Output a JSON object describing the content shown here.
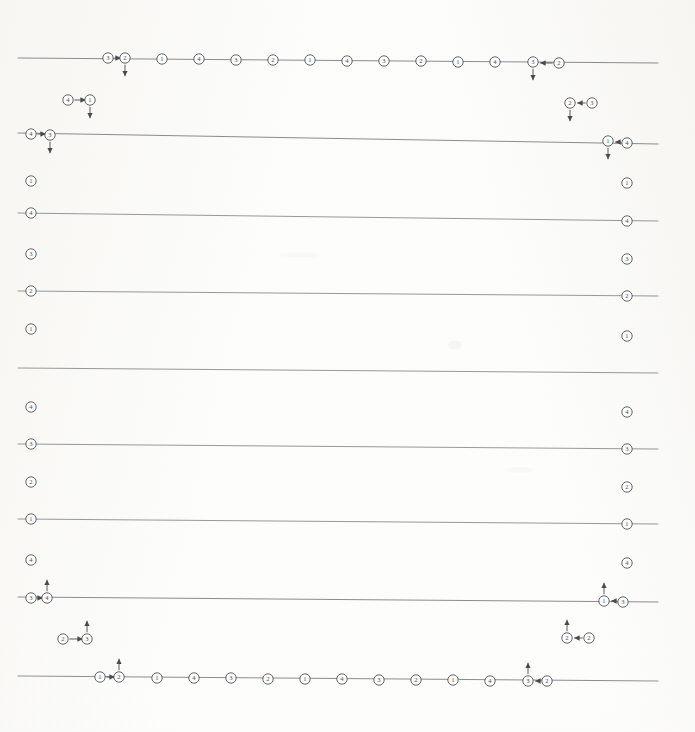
{
  "document": {
    "kind": "scanned-line-diagram",
    "width": 695,
    "height": 732,
    "background_color": "#fdfdfb",
    "ink_color": "#4a4a4a",
    "line_color": "#6b6b6b",
    "node_label_color": "#3c3c3c",
    "description": "Faded grayscale scan of a periodic lattice / transfer diagram: twelve near-horizontal rules carrying circled numeric site markers, with mirrored edge-node columns and arrow-annotated node pairs."
  },
  "geometry": {
    "line_left_x": 18,
    "line_right_x": 658,
    "node_radius": 5.2,
    "edge_left_x": 31,
    "edge_right_x": 627
  },
  "rules": [
    {
      "id": "rule-1",
      "y_left": 58,
      "y_right": 63,
      "weight": 0.9
    },
    {
      "id": "rule-2",
      "y_left": 133,
      "y_right": 144,
      "weight": 0.9
    },
    {
      "id": "rule-3",
      "y_left": 213,
      "y_right": 221,
      "weight": 0.8
    },
    {
      "id": "rule-4",
      "y_left": 291,
      "y_right": 296,
      "weight": 0.8
    },
    {
      "id": "rule-5",
      "y_left": 368,
      "y_right": 373,
      "weight": 0.8
    },
    {
      "id": "rule-6",
      "y_left": 444,
      "y_right": 449,
      "weight": 0.8
    },
    {
      "id": "rule-7",
      "y_left": 519,
      "y_right": 524,
      "weight": 0.8
    },
    {
      "id": "rule-8",
      "y_left": 597,
      "y_right": 602,
      "weight": 0.9
    },
    {
      "id": "rule-9",
      "y_left": 676,
      "y_right": 681,
      "weight": 0.9
    }
  ],
  "top_row": {
    "rule": "rule-1",
    "label": "top-site-row",
    "nodes": [
      {
        "x": 108,
        "y": 58,
        "label": "3"
      },
      {
        "x": 125,
        "y": 58,
        "label": "2",
        "down_arrow": true
      },
      {
        "x": 162,
        "y": 59,
        "label": "1"
      },
      {
        "x": 199,
        "y": 59,
        "label": "4"
      },
      {
        "x": 236,
        "y": 60,
        "label": "3"
      },
      {
        "x": 273,
        "y": 60,
        "label": "2"
      },
      {
        "x": 310,
        "y": 60,
        "label": "1"
      },
      {
        "x": 347,
        "y": 61,
        "label": "4"
      },
      {
        "x": 384,
        "y": 61,
        "label": "3"
      },
      {
        "x": 421,
        "y": 61,
        "label": "2"
      },
      {
        "x": 458,
        "y": 62,
        "label": "1"
      },
      {
        "x": 495,
        "y": 62,
        "label": "4"
      },
      {
        "x": 533,
        "y": 62,
        "label": "3",
        "down_arrow": true
      },
      {
        "x": 559,
        "y": 63,
        "label": "2"
      }
    ],
    "connectors": [
      {
        "from_x": 108,
        "to_x": 125,
        "y": 58,
        "direction": "right"
      },
      {
        "from_x": 559,
        "to_x": 536,
        "y": 63,
        "direction": "left"
      }
    ]
  },
  "bottom_row": {
    "rule": "rule-9",
    "label": "bottom-site-row",
    "nodes": [
      {
        "x": 100,
        "y": 677,
        "label": "1"
      },
      {
        "x": 119,
        "y": 677,
        "label": "2",
        "up_arrow": true
      },
      {
        "x": 157,
        "y": 678,
        "label": "1"
      },
      {
        "x": 194,
        "y": 678,
        "label": "4"
      },
      {
        "x": 231,
        "y": 678,
        "label": "3"
      },
      {
        "x": 268,
        "y": 679,
        "label": "2"
      },
      {
        "x": 305,
        "y": 679,
        "label": "1"
      },
      {
        "x": 342,
        "y": 679,
        "label": "4"
      },
      {
        "x": 379,
        "y": 680,
        "label": "3"
      },
      {
        "x": 416,
        "y": 680,
        "label": "2"
      },
      {
        "x": 453,
        "y": 680,
        "label": "1"
      },
      {
        "x": 490,
        "y": 681,
        "label": "4"
      },
      {
        "x": 528,
        "y": 681,
        "label": "3",
        "up_arrow": true
      },
      {
        "x": 547,
        "y": 681,
        "label": "2"
      }
    ],
    "connectors": [
      {
        "from_x": 100,
        "to_x": 119,
        "y": 677,
        "direction": "right"
      },
      {
        "from_x": 547,
        "to_x": 531,
        "y": 681,
        "direction": "left"
      }
    ]
  },
  "left_column": {
    "label": "left-edge-sites",
    "nodes": [
      {
        "x": 31,
        "y": 134,
        "label": "4",
        "on_rule": true
      },
      {
        "x": 50,
        "y": 135,
        "label": "3",
        "on_rule": true,
        "down_arrow": true
      },
      {
        "x": 31,
        "y": 181,
        "label": "1",
        "on_rule": false
      },
      {
        "x": 31,
        "y": 213,
        "label": "4",
        "on_rule": true
      },
      {
        "x": 31,
        "y": 254,
        "label": "3",
        "on_rule": false
      },
      {
        "x": 31,
        "y": 291,
        "label": "2",
        "on_rule": true
      },
      {
        "x": 31,
        "y": 329,
        "label": "1",
        "on_rule": false
      },
      {
        "x": 31,
        "y": 407,
        "label": "4",
        "on_rule": false
      },
      {
        "x": 31,
        "y": 444,
        "label": "3",
        "on_rule": true
      },
      {
        "x": 31,
        "y": 482,
        "label": "2",
        "on_rule": false
      },
      {
        "x": 31,
        "y": 519,
        "label": "1",
        "on_rule": true
      },
      {
        "x": 31,
        "y": 560,
        "label": "4",
        "on_rule": false
      },
      {
        "x": 31,
        "y": 598,
        "label": "3",
        "on_rule": true
      },
      {
        "x": 47,
        "y": 598,
        "label": "4",
        "on_rule": true,
        "up_arrow": true
      }
    ],
    "connectors": [
      {
        "from_x": 31,
        "to_x": 50,
        "y": 134,
        "direction": "right"
      },
      {
        "from_x": 31,
        "to_x": 47,
        "y": 598,
        "direction": "right"
      }
    ]
  },
  "right_column": {
    "label": "right-edge-sites",
    "nodes": [
      {
        "x": 608,
        "y": 141,
        "label": "1",
        "on_rule": true,
        "down_arrow": true
      },
      {
        "x": 627,
        "y": 143,
        "label": "4",
        "on_rule": true
      },
      {
        "x": 627,
        "y": 183,
        "label": "1",
        "on_rule": false
      },
      {
        "x": 627,
        "y": 221,
        "label": "4",
        "on_rule": true
      },
      {
        "x": 627,
        "y": 259,
        "label": "3",
        "on_rule": false
      },
      {
        "x": 627,
        "y": 296,
        "label": "2",
        "on_rule": true
      },
      {
        "x": 627,
        "y": 336,
        "label": "1",
        "on_rule": false
      },
      {
        "x": 627,
        "y": 412,
        "label": "4",
        "on_rule": false
      },
      {
        "x": 627,
        "y": 449,
        "label": "3",
        "on_rule": true
      },
      {
        "x": 627,
        "y": 487,
        "label": "2",
        "on_rule": false
      },
      {
        "x": 627,
        "y": 524,
        "label": "1",
        "on_rule": true
      },
      {
        "x": 627,
        "y": 563,
        "label": "4",
        "on_rule": false
      },
      {
        "x": 604,
        "y": 601,
        "label": "1",
        "on_rule": true,
        "up_arrow": true
      },
      {
        "x": 623,
        "y": 602,
        "label": "3",
        "on_rule": true
      }
    ],
    "connectors": [
      {
        "from_x": 627,
        "to_x": 611,
        "y": 142,
        "direction": "left"
      },
      {
        "from_x": 623,
        "to_x": 607,
        "y": 601,
        "direction": "left"
      }
    ]
  },
  "floating_pairs": [
    {
      "id": "pair-top-left",
      "nodes": [
        {
          "x": 68,
          "y": 100,
          "label": "4"
        },
        {
          "x": 90,
          "y": 100,
          "label": "1",
          "down_arrow": true
        }
      ],
      "connector": {
        "from_x": 68,
        "to_x": 90,
        "y": 100,
        "direction": "right"
      }
    },
    {
      "id": "pair-top-right",
      "nodes": [
        {
          "x": 570,
          "y": 103,
          "label": "2",
          "down_arrow": true
        },
        {
          "x": 592,
          "y": 103,
          "label": "3"
        }
      ],
      "connector": {
        "from_x": 592,
        "to_x": 573,
        "y": 103,
        "direction": "left"
      }
    },
    {
      "id": "pair-bottom-left",
      "nodes": [
        {
          "x": 63,
          "y": 639,
          "label": "2"
        },
        {
          "x": 87,
          "y": 639,
          "label": "3",
          "up_arrow": true
        }
      ],
      "connector": {
        "from_x": 63,
        "to_x": 87,
        "y": 639,
        "direction": "right"
      }
    },
    {
      "id": "pair-bottom-right",
      "nodes": [
        {
          "x": 567,
          "y": 638,
          "label": "2",
          "up_arrow": true
        },
        {
          "x": 589,
          "y": 638,
          "label": "2"
        }
      ],
      "connector": {
        "from_x": 589,
        "to_x": 570,
        "y": 638,
        "direction": "left"
      }
    }
  ],
  "paper_marks": [
    {
      "x": 455,
      "y": 345,
      "w": 14,
      "h": 9,
      "opacity": 0.1
    },
    {
      "x": 300,
      "y": 255,
      "w": 40,
      "h": 5,
      "opacity": 0.05
    },
    {
      "x": 520,
      "y": 470,
      "w": 26,
      "h": 6,
      "opacity": 0.05
    },
    {
      "x": 170,
      "y": 520,
      "w": 30,
      "h": 5,
      "opacity": 0.04
    }
  ]
}
